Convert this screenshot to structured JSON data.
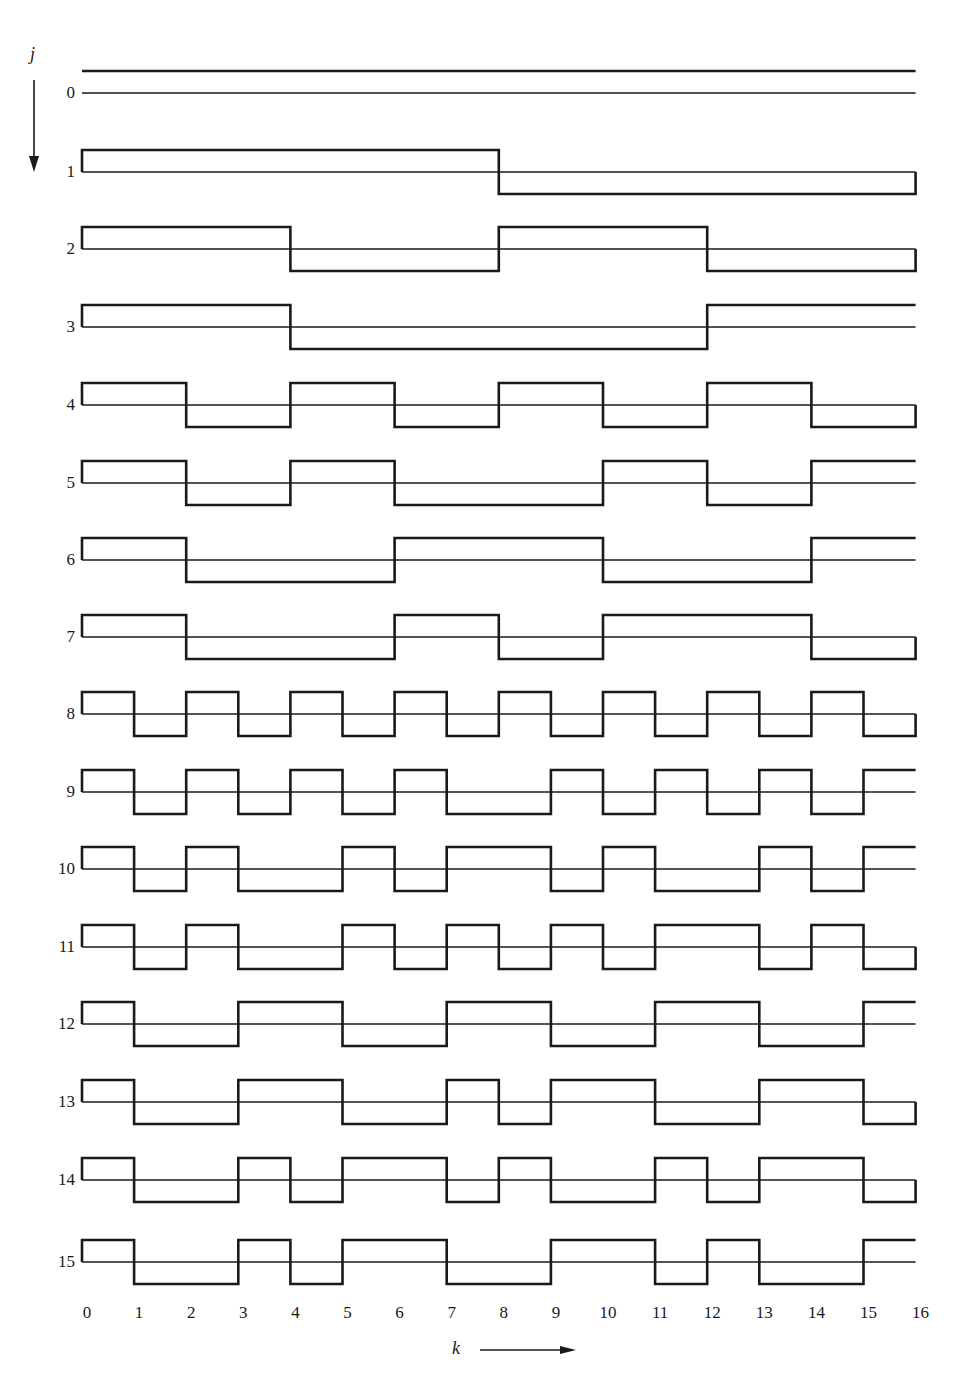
{
  "figure": {
    "vertical_axis_label": "j",
    "horizontal_axis_label": "k",
    "line_color": "#1a1a1a",
    "background": "#ffffff"
  },
  "chart_data": {
    "type": "step",
    "title": "",
    "xlabel": "k",
    "ylabel": "j",
    "xlim": [
      0,
      16
    ],
    "x_ticks": [
      "0",
      "1",
      "2",
      "3",
      "4",
      "5",
      "6",
      "7",
      "8",
      "9",
      "10",
      "11",
      "12",
      "13",
      "14",
      "15",
      "16"
    ],
    "row_labels": [
      "0",
      "1",
      "2",
      "3",
      "4",
      "5",
      "6",
      "7",
      "8",
      "9",
      "10",
      "11",
      "12",
      "13",
      "14",
      "15"
    ],
    "series": [
      {
        "name": "0",
        "values": [
          1,
          1,
          1,
          1,
          1,
          1,
          1,
          1,
          1,
          1,
          1,
          1,
          1,
          1,
          1,
          1
        ]
      },
      {
        "name": "1",
        "values": [
          1,
          1,
          1,
          1,
          1,
          1,
          1,
          1,
          -1,
          -1,
          -1,
          -1,
          -1,
          -1,
          -1,
          -1
        ]
      },
      {
        "name": "2",
        "values": [
          1,
          1,
          1,
          1,
          -1,
          -1,
          -1,
          -1,
          1,
          1,
          1,
          1,
          -1,
          -1,
          -1,
          -1
        ]
      },
      {
        "name": "3",
        "values": [
          1,
          1,
          1,
          1,
          -1,
          -1,
          -1,
          -1,
          -1,
          -1,
          -1,
          -1,
          1,
          1,
          1,
          1
        ]
      },
      {
        "name": "4",
        "values": [
          1,
          1,
          -1,
          -1,
          1,
          1,
          -1,
          -1,
          1,
          1,
          -1,
          -1,
          1,
          1,
          -1,
          -1
        ]
      },
      {
        "name": "5",
        "values": [
          1,
          1,
          -1,
          -1,
          1,
          1,
          -1,
          -1,
          -1,
          -1,
          1,
          1,
          -1,
          -1,
          1,
          1
        ]
      },
      {
        "name": "6",
        "values": [
          1,
          1,
          -1,
          -1,
          -1,
          -1,
          1,
          1,
          1,
          1,
          -1,
          -1,
          -1,
          -1,
          1,
          1
        ]
      },
      {
        "name": "7",
        "values": [
          1,
          1,
          -1,
          -1,
          -1,
          -1,
          1,
          1,
          -1,
          -1,
          1,
          1,
          1,
          1,
          -1,
          -1
        ]
      },
      {
        "name": "8",
        "values": [
          1,
          -1,
          1,
          -1,
          1,
          -1,
          1,
          -1,
          1,
          -1,
          1,
          -1,
          1,
          -1,
          1,
          -1
        ]
      },
      {
        "name": "9",
        "values": [
          1,
          -1,
          1,
          -1,
          1,
          -1,
          1,
          -1,
          -1,
          1,
          -1,
          1,
          -1,
          1,
          -1,
          1
        ]
      },
      {
        "name": "10",
        "values": [
          1,
          -1,
          1,
          -1,
          -1,
          1,
          -1,
          1,
          1,
          -1,
          1,
          -1,
          -1,
          1,
          -1,
          1
        ]
      },
      {
        "name": "11",
        "values": [
          1,
          -1,
          1,
          -1,
          -1,
          1,
          -1,
          1,
          -1,
          1,
          -1,
          1,
          1,
          -1,
          1,
          -1
        ]
      },
      {
        "name": "12",
        "values": [
          1,
          -1,
          -1,
          1,
          1,
          -1,
          -1,
          1,
          1,
          -1,
          -1,
          1,
          1,
          -1,
          -1,
          1
        ]
      },
      {
        "name": "13",
        "values": [
          1,
          -1,
          -1,
          1,
          1,
          -1,
          -1,
          1,
          -1,
          1,
          1,
          -1,
          -1,
          1,
          1,
          -1
        ]
      },
      {
        "name": "14",
        "values": [
          1,
          -1,
          -1,
          1,
          -1,
          1,
          1,
          -1,
          1,
          -1,
          -1,
          1,
          -1,
          1,
          1,
          -1
        ]
      },
      {
        "name": "15",
        "values": [
          1,
          -1,
          -1,
          1,
          -1,
          1,
          1,
          -1,
          -1,
          1,
          1,
          -1,
          1,
          -1,
          -1,
          1
        ]
      }
    ]
  }
}
